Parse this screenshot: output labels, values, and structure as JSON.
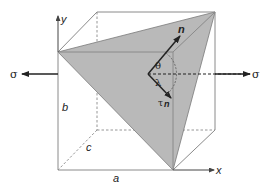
{
  "diagram": {
    "type": "schmid-law-cube",
    "labels": {
      "y_axis": "y",
      "x_axis": "x",
      "sigma_left": "σ",
      "sigma_right": "σ",
      "normal": "n",
      "theta": "θ",
      "lambda": "λ",
      "tau": "τ",
      "tau_sub": "n",
      "edge_b": "b",
      "edge_c": "c",
      "edge_a": "a"
    },
    "colors": {
      "plane_fill": "#b9b9b9",
      "edges": "#8a8a8a",
      "arrows": "#222222",
      "background": "#ffffff"
    }
  }
}
